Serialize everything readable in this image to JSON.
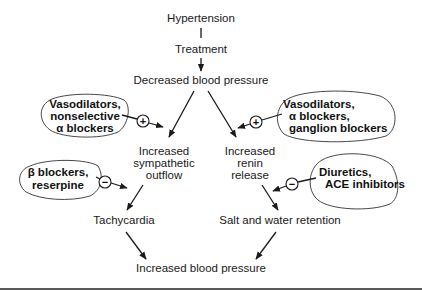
{
  "diagram": {
    "title_node": "Hypertension",
    "nodes": {
      "treatment": "Treatment",
      "decreased_bp": "Decreased blood pressure",
      "sympathetic": [
        "Increased",
        "sympathetic",
        "outflow"
      ],
      "renin": [
        "Increased",
        "renin",
        "release"
      ],
      "tachycardia": "Tachycardia",
      "salt_water": "Salt and water retention",
      "increased_bp": "Increased blood pressure"
    },
    "drug_groups": [
      {
        "id": "vasodilators-nonselective",
        "lines": [
          "Vasodilators,",
          "nonselective",
          "α blockers"
        ],
        "effect": "+",
        "target": "Increased sympathetic outflow"
      },
      {
        "id": "beta-blockers",
        "lines": [
          "β blockers,",
          "reserpine"
        ],
        "effect": "−",
        "target": "Increased sympathetic outflow → Tachycardia"
      },
      {
        "id": "vasodilators-ganglion",
        "lines": [
          "Vasodilators,",
          "α blockers,",
          "ganglion blockers"
        ],
        "effect": "+",
        "target": "Increased renin release"
      },
      {
        "id": "diuretics",
        "lines": [
          "Diuretics,",
          "ACE inhibitors"
        ],
        "effect": "−",
        "target": "Increased renin release → Salt and water retention"
      }
    ],
    "colors": {
      "ink": "#1a1a1a",
      "background": "#ffffff"
    }
  }
}
